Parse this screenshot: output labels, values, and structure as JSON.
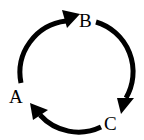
{
  "diagram": {
    "type": "cycle",
    "nodes": [
      {
        "id": "A",
        "label": "A"
      },
      {
        "id": "B",
        "label": "B"
      },
      {
        "id": "C",
        "label": "C"
      }
    ],
    "edges": [
      {
        "from": "A",
        "to": "B"
      },
      {
        "from": "B",
        "to": "C"
      },
      {
        "from": "C",
        "to": "A"
      }
    ],
    "colors": {
      "stroke": "#000000",
      "background": "#ffffff"
    }
  }
}
